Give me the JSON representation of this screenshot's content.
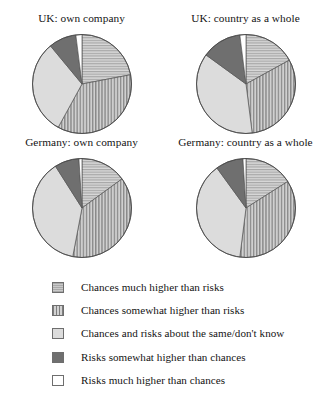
{
  "chart_data": {
    "type": "pie",
    "title": "",
    "legend_position": "bottom",
    "categories": [
      "Chances much higher than risks",
      "Chances somewhat higher than risks",
      "Chances and risks about the same/don't know",
      "Risks somewhat higher than chances",
      "Risks much higher than chances"
    ],
    "category_patterns": [
      "horizontal-hatch",
      "vertical-stripe",
      "light-solid",
      "dark-solid",
      "white-empty"
    ],
    "category_colors": [
      "#c9c9c9",
      "#b4b4b4",
      "#dcdcdc",
      "#6f6f6f",
      "#ffffff"
    ],
    "charts": [
      {
        "title": "UK: own company",
        "values": [
          22,
          36,
          31,
          9,
          2
        ]
      },
      {
        "title": "UK: country as a whole",
        "values": [
          17,
          31,
          37,
          13,
          2
        ]
      },
      {
        "title": "Germany: own company",
        "values": [
          15,
          38,
          38,
          8,
          1
        ]
      },
      {
        "title": "Germany: country as a whole",
        "values": [
          16,
          36,
          38,
          9,
          1
        ]
      }
    ]
  },
  "legend": {
    "items": [
      {
        "label": "Chances much higher than risks",
        "swatch": "horizontal-hatch"
      },
      {
        "label": "Chances somewhat higher than risks",
        "swatch": "vertical-stripe"
      },
      {
        "label": "Chances and risks about the same/don't know",
        "swatch": "light-solid"
      },
      {
        "label": "Risks somewhat higher than chances",
        "swatch": "dark-solid"
      },
      {
        "label": "Risks much higher than chances",
        "swatch": "white-empty"
      }
    ]
  }
}
